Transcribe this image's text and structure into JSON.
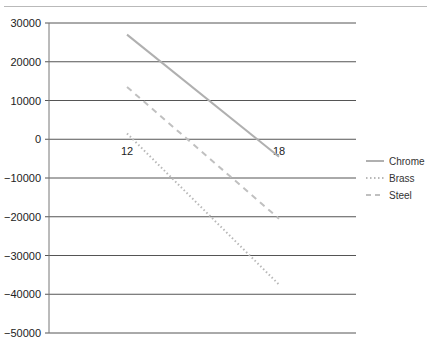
{
  "chart_data": {
    "type": "line",
    "title": "",
    "xlabel": "",
    "ylabel": "",
    "categories": [
      "12",
      "18"
    ],
    "x": [
      12,
      18
    ],
    "series": [
      {
        "name": "Chrome",
        "values": [
          27000,
          -4500
        ],
        "style": "solid",
        "color": "#b0b0b0"
      },
      {
        "name": "Brass",
        "values": [
          1500,
          -37500
        ],
        "style": "dotted",
        "color": "#b8b8b8"
      },
      {
        "name": "Steel",
        "values": [
          13500,
          -20500
        ],
        "style": "dashed",
        "color": "#c0c0c0"
      }
    ],
    "ylim": [
      -50000,
      30000
    ],
    "yticks": [
      30000,
      20000,
      10000,
      0,
      -10000,
      -20000,
      -30000,
      -40000,
      -50000
    ],
    "ytick_labels": [
      "30000",
      "20000",
      "10000",
      "0",
      "−10000",
      "−20000",
      "−30000",
      "−40000",
      "−50000"
    ],
    "grid": true,
    "legend_position": "right"
  },
  "legend": {
    "items": [
      {
        "label": "Chrome"
      },
      {
        "label": "Brass"
      },
      {
        "label": "Steel"
      }
    ]
  },
  "colors": {
    "grid": "#555555",
    "axis": "#666666"
  }
}
